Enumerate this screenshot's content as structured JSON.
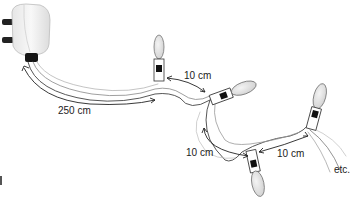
{
  "diagram": {
    "labels": {
      "cord_to_first": "250 cm",
      "first_to_second": "10 cm",
      "second_to_third": "10 cm",
      "third_to_fourth": "10 cm",
      "continuation": "etc."
    },
    "components": [
      "plug",
      "cable",
      "bulb-1",
      "bulb-2",
      "bulb-3",
      "bulb-4"
    ]
  }
}
